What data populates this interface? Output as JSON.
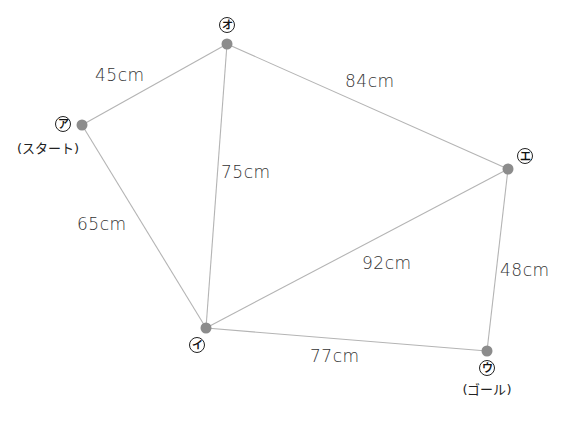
{
  "diagram": {
    "type": "weighted-graph",
    "unit": "cm",
    "nodes": [
      {
        "id": "a",
        "label": "ア",
        "sublabel": "(スタート)",
        "role": "start"
      },
      {
        "id": "i",
        "label": "イ",
        "sublabel": "",
        "role": ""
      },
      {
        "id": "u",
        "label": "ウ",
        "sublabel": "(ゴール)",
        "role": "goal"
      },
      {
        "id": "e",
        "label": "エ",
        "sublabel": "",
        "role": ""
      },
      {
        "id": "o",
        "label": "オ",
        "sublabel": "",
        "role": ""
      }
    ],
    "edges": [
      {
        "from": "a",
        "to": "o",
        "length": 45,
        "label": "45cm"
      },
      {
        "from": "o",
        "to": "e",
        "length": 84,
        "label": "84cm"
      },
      {
        "from": "o",
        "to": "i",
        "length": 75,
        "label": "75cm"
      },
      {
        "from": "a",
        "to": "i",
        "length": 65,
        "label": "65cm"
      },
      {
        "from": "i",
        "to": "e",
        "length": 92,
        "label": "92cm"
      },
      {
        "from": "e",
        "to": "u",
        "length": 48,
        "label": "48cm"
      },
      {
        "from": "i",
        "to": "u",
        "length": 77,
        "label": "77cm"
      }
    ]
  }
}
